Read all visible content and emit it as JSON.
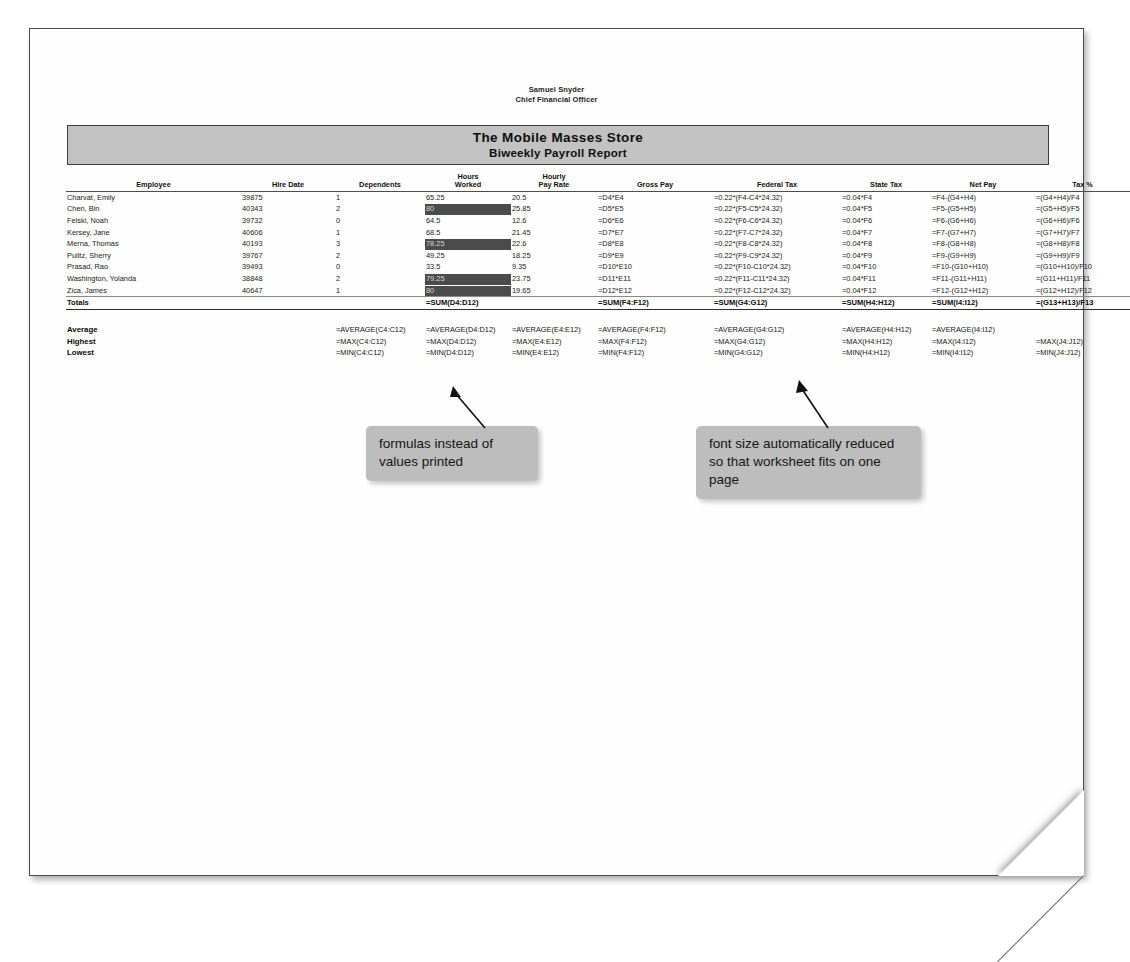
{
  "document": {
    "officer_name": "Samuel Snyder",
    "officer_title": "Chief Financial Officer",
    "banner_title": "The Mobile Masses Store",
    "banner_subtitle": "Biweekly Payroll Report"
  },
  "table": {
    "headers": {
      "employee": "Employee",
      "hire_date": "Hire Date",
      "dependents": "Dependents",
      "hours_worked_l1": "Hours",
      "hours_worked_l2": "Worked",
      "hourly_rate_l1": "Hourly",
      "hourly_rate_l2": "Pay Rate",
      "gross_pay": "Gross Pay",
      "federal_tax": "Federal Tax",
      "state_tax": "State Tax",
      "net_pay": "Net Pay",
      "tax_pct": "Tax %"
    },
    "rows": [
      {
        "employee": "Charvat, Emily",
        "hire_date": "39875",
        "dependents": "1",
        "hours_worked": "65.25",
        "hours_highlighted": false,
        "hourly_rate": "20.5",
        "gross_pay": "=D4*E4",
        "federal_tax": "=0.22*(F4-C4*24.32)",
        "state_tax": "=0.04*F4",
        "net_pay": "=F4-(G4+H4)",
        "tax_pct": "=(G4+H4)/F4"
      },
      {
        "employee": "Chen, Bin",
        "hire_date": "40343",
        "dependents": "2",
        "hours_worked": "80",
        "hours_highlighted": true,
        "hourly_rate": "25.85",
        "gross_pay": "=D5*E5",
        "federal_tax": "=0.22*(F5-C5*24.32)",
        "state_tax": "=0.04*F5",
        "net_pay": "=F5-(G5+H5)",
        "tax_pct": "=(G5+H5)/F5"
      },
      {
        "employee": "Felski, Noah",
        "hire_date": "39732",
        "dependents": "0",
        "hours_worked": "64.5",
        "hours_highlighted": false,
        "hourly_rate": "12.6",
        "gross_pay": "=D6*E6",
        "federal_tax": "=0.22*(F6-C6*24.32)",
        "state_tax": "=0.04*F6",
        "net_pay": "=F6-(G6+H6)",
        "tax_pct": "=(G6+H6)/F6"
      },
      {
        "employee": "Kersey, Jane",
        "hire_date": "40606",
        "dependents": "1",
        "hours_worked": "68.5",
        "hours_highlighted": false,
        "hourly_rate": "21.45",
        "gross_pay": "=D7*E7",
        "federal_tax": "=0.22*(F7-C7*24.32)",
        "state_tax": "=0.04*F7",
        "net_pay": "=F7-(G7+H7)",
        "tax_pct": "=(G7+H7)/F7"
      },
      {
        "employee": "Merna, Thomas",
        "hire_date": "40193",
        "dependents": "3",
        "hours_worked": "78.25",
        "hours_highlighted": true,
        "hourly_rate": "22.6",
        "gross_pay": "=D8*E8",
        "federal_tax": "=0.22*(F8-C8*24.32)",
        "state_tax": "=0.04*F8",
        "net_pay": "=F8-(G8+H8)",
        "tax_pct": "=(G8+H8)/F8"
      },
      {
        "employee": "Pulitz, Sherry",
        "hire_date": "39767",
        "dependents": "2",
        "hours_worked": "49.25",
        "hours_highlighted": false,
        "hourly_rate": "18.25",
        "gross_pay": "=D9*E9",
        "federal_tax": "=0.22*(F9-C9*24.32)",
        "state_tax": "=0.04*F9",
        "net_pay": "=F9-(G9+H9)",
        "tax_pct": "=(G9+H9)/F9"
      },
      {
        "employee": "Prasad, Rao",
        "hire_date": "39493",
        "dependents": "0",
        "hours_worked": "33.5",
        "hours_highlighted": false,
        "hourly_rate": "9.35",
        "gross_pay": "=D10*E10",
        "federal_tax": "=0.22*(F10-C10*24.32)",
        "state_tax": "=0.04*F10",
        "net_pay": "=F10-(G10+H10)",
        "tax_pct": "=(G10+H10)/F10"
      },
      {
        "employee": "Washington, Yolanda",
        "hire_date": "38848",
        "dependents": "2",
        "hours_worked": "79.25",
        "hours_highlighted": true,
        "hourly_rate": "23.75",
        "gross_pay": "=D11*E11",
        "federal_tax": "=0.22*(F11-C11*24.32)",
        "state_tax": "=0.04*F11",
        "net_pay": "=F11-(G11+H11)",
        "tax_pct": "=(G11+H11)/F11"
      },
      {
        "employee": "Zica, James",
        "hire_date": "40647",
        "dependents": "1",
        "hours_worked": "80",
        "hours_highlighted": true,
        "hourly_rate": "19.65",
        "gross_pay": "=D12*E12",
        "federal_tax": "=0.22*(F12-C12*24.32)",
        "state_tax": "=0.04*F12",
        "net_pay": "=F12-(G12+H12)",
        "tax_pct": "=(G12+H12)/F12"
      }
    ],
    "totals": {
      "label": "Totals",
      "hours_worked": "=SUM(D4:D12)",
      "gross_pay": "=SUM(F4:F12)",
      "federal_tax": "=SUM(G4:G12)",
      "state_tax": "=SUM(H4:H12)",
      "net_pay": "=SUM(I4:I12)",
      "tax_pct": "=(G13+H13)/F13"
    },
    "stats": [
      {
        "label": "Average",
        "dependents": "=AVERAGE(C4:C12)",
        "hours_worked": "=AVERAGE(D4:D12)",
        "hourly_rate": "=AVERAGE(E4:E12)",
        "gross_pay": "=AVERAGE(F4:F12)",
        "federal_tax": "=AVERAGE(G4:G12)",
        "state_tax": "=AVERAGE(H4:H12)",
        "net_pay": "=AVERAGE(I4:I12)",
        "tax_pct": ""
      },
      {
        "label": "Highest",
        "dependents": "=MAX(C4:C12)",
        "hours_worked": "=MAX(D4:D12)",
        "hourly_rate": "=MAX(E4:E12)",
        "gross_pay": "=MAX(F4:F12)",
        "federal_tax": "=MAX(G4:G12)",
        "state_tax": "=MAX(H4:H12)",
        "net_pay": "=MAX(I4:I12)",
        "tax_pct": "=MAX(J4:J12)"
      },
      {
        "label": "Lowest",
        "dependents": "=MIN(C4:C12)",
        "hours_worked": "=MIN(D4:D12)",
        "hourly_rate": "=MIN(E4:E12)",
        "gross_pay": "=MIN(F4:F12)",
        "federal_tax": "=MIN(G4:G12)",
        "state_tax": "=MIN(H4:H12)",
        "net_pay": "=MIN(I4:I12)",
        "tax_pct": "=MIN(J4:J12)"
      }
    ]
  },
  "annotations": {
    "formulas_note": "formulas instead of values printed",
    "fontsize_note": "font size automatically reduced so that worksheet fits on one page"
  },
  "colors": {
    "banner_fill": "#c2c2c2",
    "highlight_fill": "#4b4b4b",
    "callout_fill": "#bdbdbd",
    "paper": "#fefefe"
  }
}
